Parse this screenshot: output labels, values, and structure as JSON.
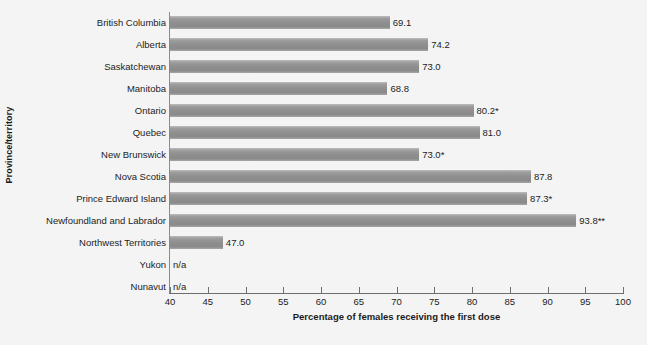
{
  "chart_data": {
    "type": "bar",
    "orientation": "horizontal",
    "title": "",
    "xlabel": "Percentage of females receiving the first dose",
    "ylabel": "Province/territory",
    "xlim": [
      40,
      100
    ],
    "xticks": [
      40,
      45,
      50,
      55,
      60,
      65,
      70,
      75,
      80,
      85,
      90,
      95,
      100
    ],
    "grid": false,
    "legend": null,
    "categories": [
      "British Columbia",
      "Alberta",
      "Saskatchewan",
      "Manitoba",
      "Ontario",
      "Quebec",
      "New Brunswick",
      "Nova Scotia",
      "Prince Edward Island",
      "Newfoundland and Labrador",
      "Northwest Territories",
      "Yukon",
      "Nunavut"
    ],
    "values": [
      69.1,
      74.2,
      73.0,
      68.8,
      80.2,
      81.0,
      73.0,
      87.8,
      87.3,
      93.8,
      47.0,
      null,
      null
    ],
    "data_labels": [
      "69.1",
      "74.2",
      "73.0",
      "68.8",
      "80.2*",
      "81.0",
      "73.0*",
      "87.8",
      "87.3*",
      "93.8**",
      "47.0",
      "n/a",
      "n/a"
    ],
    "bars": [
      {
        "category": "British Columbia",
        "value": 69.1,
        "label": "69.1"
      },
      {
        "category": "Alberta",
        "value": 74.2,
        "label": "74.2"
      },
      {
        "category": "Saskatchewan",
        "value": 73.0,
        "label": "73.0"
      },
      {
        "category": "Manitoba",
        "value": 68.8,
        "label": "68.8"
      },
      {
        "category": "Ontario",
        "value": 80.2,
        "label": "80.2*"
      },
      {
        "category": "Quebec",
        "value": 81.0,
        "label": "81.0"
      },
      {
        "category": "New Brunswick",
        "value": 73.0,
        "label": "73.0*"
      },
      {
        "category": "Nova Scotia",
        "value": 87.8,
        "label": "87.8"
      },
      {
        "category": "Prince Edward Island",
        "value": 87.3,
        "label": "87.3*"
      },
      {
        "category": "Newfoundland and Labrador",
        "value": 93.8,
        "label": "93.8**"
      },
      {
        "category": "Northwest Territories",
        "value": 47.0,
        "label": "47.0"
      },
      {
        "category": "Yukon",
        "value": null,
        "label": "n/a"
      },
      {
        "category": "Nunavut",
        "value": null,
        "label": "n/a"
      }
    ],
    "colors": {
      "bar": "#919191",
      "bar_light": "#bdbdbd",
      "axis": "#6e6e6e",
      "background": "#f4f4f4",
      "text": "#1c1c1c"
    }
  }
}
